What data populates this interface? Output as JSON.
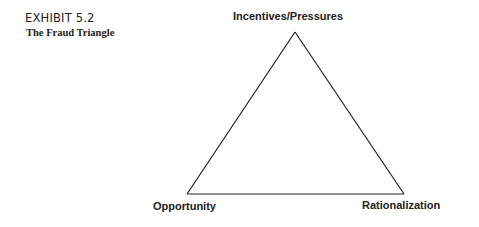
{
  "exhibit": {
    "number": "EXHIBIT 5.2",
    "title": "The Fraud Triangle"
  },
  "diagram": {
    "type": "triangle",
    "vertices": [
      {
        "id": "top",
        "label": "Incentives/Pressures"
      },
      {
        "id": "left",
        "label": "Opportunity"
      },
      {
        "id": "right",
        "label": "Rationalization"
      }
    ],
    "line_color": "#222222"
  }
}
